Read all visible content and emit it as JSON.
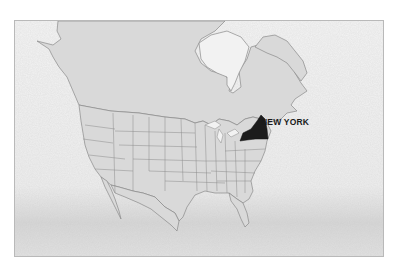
{
  "map": {
    "title": "",
    "highlighted_region": {
      "name": "New York",
      "label": "NEW YORK",
      "fill": "#1c1c1c"
    },
    "land_fill": "#d9d9d9",
    "border_stroke": "#8a8a8a",
    "water_fill": "#f2f2f2",
    "frame_border": "#b9b9b9",
    "regions_shown": [
      "Canada",
      "United States (contiguous)",
      "Alaska panhandle",
      "Greenland (partial)",
      "Mexico (northern)"
    ]
  }
}
